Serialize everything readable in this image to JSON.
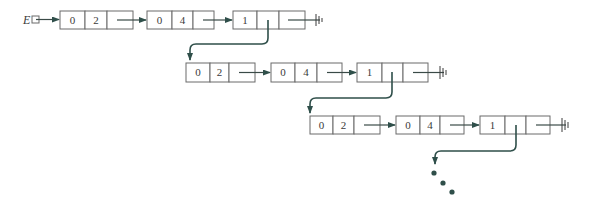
{
  "diagram": {
    "type": "linked-list-of-linked-lists",
    "head_label": "E",
    "colors": {
      "box_border": "#6a6a6a",
      "arrow": "#2f4f4a",
      "text": "#3a3a3a"
    },
    "rows": [
      {
        "nodes": [
          {
            "cells": [
              "0",
              "2",
              ""
            ]
          },
          {
            "cells": [
              "0",
              "4",
              ""
            ]
          },
          {
            "cells": [
              "1",
              "",
              ""
            ]
          }
        ],
        "terminator": "null-ground"
      },
      {
        "nodes": [
          {
            "cells": [
              "0",
              "2",
              ""
            ]
          },
          {
            "cells": [
              "0",
              "4",
              ""
            ]
          },
          {
            "cells": [
              "1",
              "",
              ""
            ]
          }
        ],
        "terminator": "null-ground"
      },
      {
        "nodes": [
          {
            "cells": [
              "0",
              "2",
              ""
            ]
          },
          {
            "cells": [
              "0",
              "4",
              ""
            ]
          },
          {
            "cells": [
              "1",
              "",
              ""
            ]
          }
        ],
        "terminator": "null-ground"
      }
    ],
    "continuation": "ellipsis-dots"
  }
}
